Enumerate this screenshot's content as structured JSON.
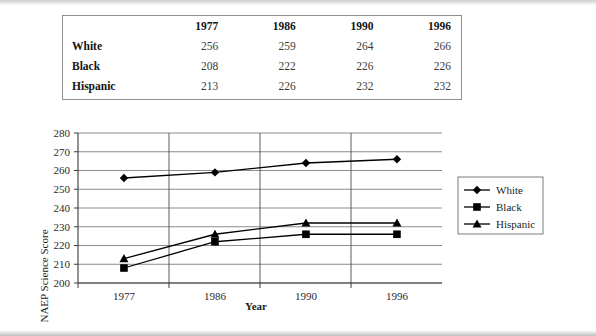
{
  "table": {
    "corner_header": "",
    "columns": [
      "1977",
      "1986",
      "1990",
      "1996"
    ],
    "rows": [
      {
        "label": "White",
        "values": [
          "256",
          "259",
          "264",
          "266"
        ]
      },
      {
        "label": "Black",
        "values": [
          "208",
          "222",
          "226",
          "226"
        ]
      },
      {
        "label": "Hispanic",
        "values": [
          "213",
          "226",
          "232",
          "232"
        ]
      }
    ]
  },
  "chart_data": {
    "type": "line",
    "title": "",
    "xlabel": "Year",
    "ylabel": "NAEP Science Score",
    "categories": [
      "1977",
      "1986",
      "1990",
      "1996"
    ],
    "series": [
      {
        "name": "White",
        "marker": "diamond",
        "values": [
          256,
          259,
          264,
          266
        ]
      },
      {
        "name": "Black",
        "marker": "square",
        "values": [
          208,
          222,
          226,
          226
        ]
      },
      {
        "name": "Hispanic",
        "marker": "triangle",
        "values": [
          213,
          226,
          232,
          232
        ]
      }
    ],
    "ylim": [
      200,
      280
    ],
    "yticks": [
      "200",
      "210",
      "220",
      "230",
      "240",
      "250",
      "260",
      "270",
      "280"
    ],
    "xticks": [
      "1977",
      "1986",
      "1990",
      "1996"
    ],
    "grid": true,
    "legend_position": "right",
    "legend": [
      "White",
      "Black",
      "Hispanic"
    ],
    "colors": {
      "line": "#000000",
      "grid": "#6f6f6f",
      "axis": "#3a3a3a"
    }
  }
}
